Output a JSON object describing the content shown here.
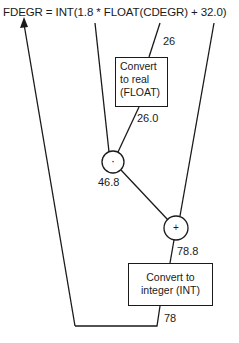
{
  "equation": "FDEGR = INT(1.8 * FLOAT(CDEGR) + 32.0)",
  "nodes": {
    "float_box": {
      "lines": [
        "Convert",
        "to real",
        "(FLOAT)"
      ]
    },
    "int_box": {
      "lines": [
        "Convert to",
        "integer (INT)"
      ]
    },
    "multiply_op": {
      "symbol": "·"
    },
    "add_op": {
      "symbol": "+"
    }
  },
  "values": {
    "cdegr": "26",
    "float_out": "26.0",
    "product": "46.8",
    "sum": "78.8",
    "result": "78"
  }
}
